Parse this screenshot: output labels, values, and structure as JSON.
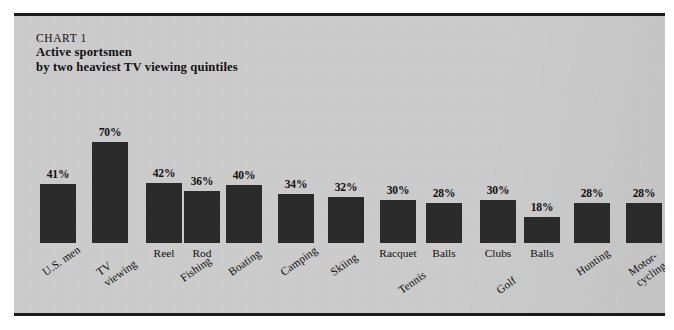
{
  "figure": {
    "kicker": "CHART 1",
    "title_line1": "Active sportsmen",
    "title_line2": "by two heaviest TV viewing quintiles",
    "background_color": "#cdcdcd",
    "bar_color": "#2b2b2b",
    "frame_color": "#1b1b1b"
  },
  "chart_data": {
    "type": "bar",
    "title": "Active sportsmen by two heaviest TV viewing quintiles",
    "subtitle": "CHART 1",
    "xlabel": "",
    "ylabel": "",
    "ylim": [
      0,
      70
    ],
    "grid": false,
    "legend": "none",
    "value_suffix": "%",
    "categories": [
      "U.S. men",
      "TV viewing",
      "Fishing - Reel",
      "Fishing - Rod",
      "Boating",
      "Camping",
      "Skiing",
      "Tennis - Racquet",
      "Tennis - Balls",
      "Golf - Clubs",
      "Golf - Balls",
      "Hunting",
      "Motor-cycling"
    ],
    "values": [
      41,
      70,
      42,
      36,
      40,
      34,
      32,
      30,
      28,
      30,
      18,
      28,
      28
    ],
    "bars": [
      {
        "value": 41,
        "label": "41%",
        "sub_label": "",
        "group_line1": "U.S. men",
        "group_line2": ""
      },
      {
        "value": 70,
        "label": "70%",
        "sub_label": "",
        "group_line1": "TV",
        "group_line2": "viewing"
      },
      {
        "value": 42,
        "label": "42%",
        "sub_label": "Reel",
        "group_line1": "",
        "group_line2": ""
      },
      {
        "value": 36,
        "label": "36%",
        "sub_label": "Rod",
        "group_line1": "Fishing",
        "group_line2": ""
      },
      {
        "value": 40,
        "label": "40%",
        "sub_label": "",
        "group_line1": "Boating",
        "group_line2": ""
      },
      {
        "value": 34,
        "label": "34%",
        "sub_label": "",
        "group_line1": "Camping",
        "group_line2": ""
      },
      {
        "value": 32,
        "label": "32%",
        "sub_label": "",
        "group_line1": "Skiing",
        "group_line2": ""
      },
      {
        "value": 30,
        "label": "30%",
        "sub_label": "Racquet",
        "group_line1": "",
        "group_line2": ""
      },
      {
        "value": 28,
        "label": "28%",
        "sub_label": "Balls",
        "group_line1": "Tennis",
        "group_line2": ""
      },
      {
        "value": 30,
        "label": "30%",
        "sub_label": "Clubs",
        "group_line1": "",
        "group_line2": ""
      },
      {
        "value": 18,
        "label": "18%",
        "sub_label": "Balls",
        "group_line1": "Golf",
        "group_line2": ""
      },
      {
        "value": 28,
        "label": "28%",
        "sub_label": "",
        "group_line1": "Hunting",
        "group_line2": ""
      },
      {
        "value": 28,
        "label": "28%",
        "sub_label": "",
        "group_line1": "Motor-",
        "group_line2": "cycling"
      }
    ]
  },
  "layout": {
    "baseline_y": 227,
    "px_per_unit": 1.44,
    "bar_width": 36,
    "bar_x": [
      26,
      78,
      132,
      170,
      212,
      264,
      314,
      366,
      412,
      466,
      510,
      560,
      612
    ],
    "sub_label_y": 231,
    "group_label_y": [
      252,
      252,
      252,
      258,
      252,
      252,
      252,
      270,
      270,
      270,
      270,
      252,
      252
    ],
    "group_label_x_offset": [
      0,
      2,
      0,
      -6,
      0,
      0,
      0,
      -30,
      -30,
      -30,
      -30,
      0,
      0
    ]
  }
}
